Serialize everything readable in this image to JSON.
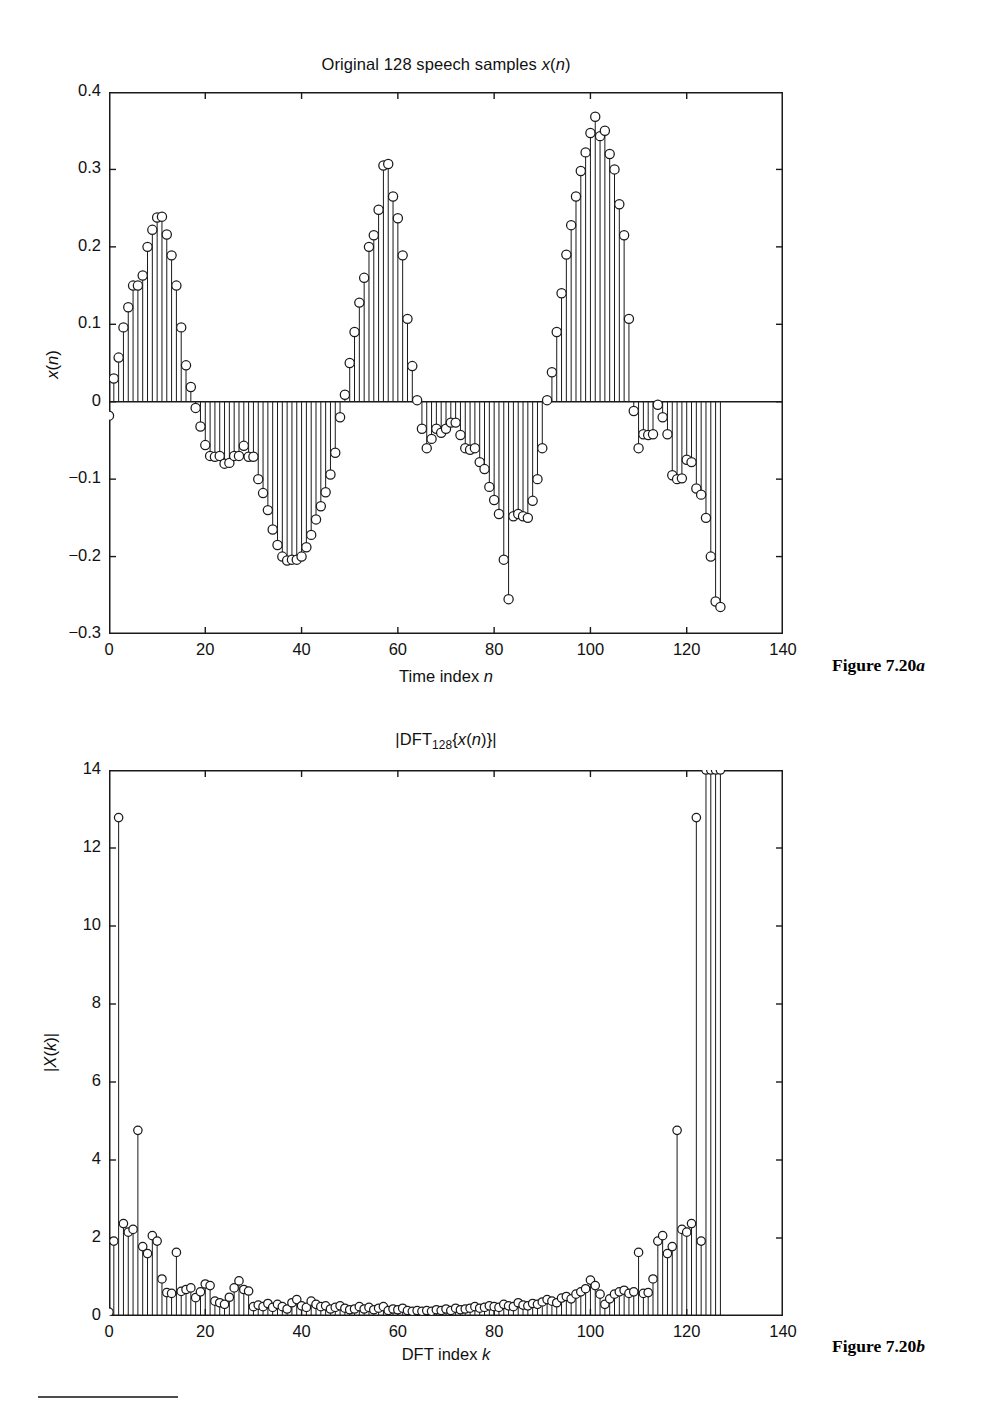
{
  "page": {
    "background": "#ffffff",
    "ink": "#1a1a1a"
  },
  "figures": [
    {
      "id": "fig-a",
      "caption_prefix": "Figure 7.20",
      "caption_suffix": "a",
      "caption_full": "Figure 7.20a"
    },
    {
      "id": "fig-b",
      "caption_prefix": "Figure 7.20",
      "caption_suffix": "b",
      "caption_full": "Figure 7.20b"
    }
  ],
  "chart_data": [
    {
      "type": "line",
      "plot_style": "stem",
      "title": "Original 128 speech samples x(n)",
      "title_parts": {
        "plain": "Original 128 speech samples ",
        "italic": "x",
        "tail": "(n)"
      },
      "xlabel": "Time index n",
      "ylabel": "x(n)",
      "xlim": [
        0,
        140
      ],
      "ylim": [
        -0.3,
        0.4
      ],
      "xticks": [
        0,
        20,
        40,
        60,
        80,
        100,
        120,
        140
      ],
      "xticklabels": [
        "0",
        "20",
        "40",
        "60",
        "80",
        "100",
        "120",
        "140"
      ],
      "yticks": [
        -0.3,
        -0.2,
        -0.1,
        0,
        0.1,
        0.2,
        0.3,
        0.4
      ],
      "yticklabels": [
        "-0.3",
        "-0.2",
        "-0.1",
        "0",
        "0.1",
        "0.2",
        "0.3",
        "0.4"
      ],
      "grid": false,
      "legend": null,
      "marker": "circle-open",
      "baseline": 0,
      "x": [
        0,
        1,
        2,
        3,
        4,
        5,
        6,
        7,
        8,
        9,
        10,
        11,
        12,
        13,
        14,
        15,
        16,
        17,
        18,
        19,
        20,
        21,
        22,
        23,
        24,
        25,
        26,
        27,
        28,
        29,
        30,
        31,
        32,
        33,
        34,
        35,
        36,
        37,
        38,
        39,
        40,
        41,
        42,
        43,
        44,
        45,
        46,
        47,
        48,
        49,
        50,
        51,
        52,
        53,
        54,
        55,
        56,
        57,
        58,
        59,
        60,
        61,
        62,
        63,
        64,
        65,
        66,
        67,
        68,
        69,
        70,
        71,
        72,
        73,
        74,
        75,
        76,
        77,
        78,
        79,
        80,
        81,
        82,
        83,
        84,
        85,
        86,
        87,
        88,
        89,
        90,
        91,
        92,
        93,
        94,
        95,
        96,
        97,
        98,
        99,
        100,
        101,
        102,
        103,
        104,
        105,
        106,
        107,
        108,
        109,
        110,
        111,
        112,
        113,
        114,
        115,
        116,
        117,
        118,
        119,
        120,
        121,
        122,
        123,
        124,
        125,
        126,
        127
      ],
      "values": [
        -0.018,
        0.03,
        0.057,
        0.096,
        0.122,
        0.15,
        0.15,
        0.163,
        0.2,
        0.222,
        0.238,
        0.239,
        0.216,
        0.189,
        0.15,
        0.096,
        0.047,
        0.019,
        -0.008,
        -0.032,
        -0.056,
        -0.07,
        -0.071,
        -0.07,
        -0.08,
        -0.079,
        -0.07,
        -0.07,
        -0.057,
        -0.071,
        -0.071,
        -0.1,
        -0.118,
        -0.14,
        -0.165,
        -0.185,
        -0.2,
        -0.205,
        -0.204,
        -0.204,
        -0.2,
        -0.188,
        -0.172,
        -0.152,
        -0.135,
        -0.117,
        -0.094,
        -0.066,
        -0.02,
        0.009,
        0.05,
        0.09,
        0.128,
        0.16,
        0.2,
        0.215,
        0.248,
        0.305,
        0.307,
        0.265,
        0.237,
        0.189,
        0.107,
        0.046,
        0.002,
        -0.035,
        -0.06,
        -0.048,
        -0.035,
        -0.04,
        -0.035,
        -0.027,
        -0.027,
        -0.043,
        -0.06,
        -0.062,
        -0.06,
        -0.078,
        -0.087,
        -0.11,
        -0.127,
        -0.145,
        -0.204,
        -0.255,
        -0.148,
        -0.145,
        -0.148,
        -0.15,
        -0.128,
        -0.1,
        -0.06,
        0.002,
        0.038,
        0.09,
        0.14,
        0.19,
        0.228,
        0.265,
        0.298,
        0.322,
        0.347,
        0.368,
        0.343,
        0.35,
        0.32,
        0.3,
        0.255,
        0.215,
        0.107,
        -0.012,
        -0.06,
        -0.042,
        -0.043,
        -0.042,
        -0.004,
        -0.02,
        -0.042,
        -0.095,
        -0.1,
        -0.099,
        -0.075,
        -0.078,
        -0.112,
        -0.12,
        -0.15,
        -0.2,
        -0.258,
        -0.265,
        -0.19
      ],
      "n_samples": 128
    },
    {
      "type": "line",
      "plot_style": "stem",
      "title": "|DFT128{x(n)}|",
      "title_parts": {
        "pre": "|DFT",
        "sub": "128",
        "mid": "{",
        "italic": "x",
        "tail": "(n)}|"
      },
      "xlabel": "DFT index k",
      "ylabel": "|X(k)|",
      "xlim": [
        0,
        140
      ],
      "ylim": [
        0,
        14
      ],
      "xticks": [
        0,
        20,
        40,
        60,
        80,
        100,
        120,
        140
      ],
      "xticklabels": [
        "0",
        "20",
        "40",
        "60",
        "80",
        "100",
        "120",
        "140"
      ],
      "yticks": [
        0,
        2,
        4,
        6,
        8,
        10,
        12,
        14
      ],
      "yticklabels": [
        "0",
        "2",
        "4",
        "6",
        "8",
        "10",
        "12",
        "14"
      ],
      "grid": false,
      "legend": null,
      "marker": "circle-open",
      "baseline": 0,
      "x": [
        0,
        1,
        2,
        3,
        4,
        5,
        6,
        7,
        8,
        9,
        10,
        11,
        12,
        13,
        14,
        15,
        16,
        17,
        18,
        19,
        20,
        21,
        22,
        23,
        24,
        25,
        26,
        27,
        28,
        29,
        30,
        31,
        32,
        33,
        34,
        35,
        36,
        37,
        38,
        39,
        40,
        41,
        42,
        43,
        44,
        45,
        46,
        47,
        48,
        49,
        50,
        51,
        52,
        53,
        54,
        55,
        56,
        57,
        58,
        59,
        60,
        61,
        62,
        63,
        64,
        65,
        66,
        67,
        68,
        69,
        70,
        71,
        72,
        73,
        74,
        75,
        76,
        77,
        78,
        79,
        80,
        81,
        82,
        83,
        84,
        85,
        86,
        87,
        88,
        89,
        90,
        91,
        92,
        93,
        94,
        95,
        96,
        97,
        98,
        99,
        100,
        101,
        102,
        103,
        104,
        105,
        106,
        107,
        108,
        109,
        110,
        111,
        112,
        113,
        114,
        115,
        116,
        117,
        118,
        119,
        120,
        121,
        122,
        123,
        124,
        125,
        126,
        127
      ],
      "values": [
        0.1,
        1.92,
        12.78,
        2.37,
        2.15,
        2.22,
        4.76,
        1.78,
        1.6,
        2.06,
        1.92,
        0.95,
        0.6,
        0.58,
        1.63,
        0.63,
        0.68,
        0.72,
        0.47,
        0.62,
        0.82,
        0.78,
        0.38,
        0.34,
        0.3,
        0.48,
        0.72,
        0.9,
        0.68,
        0.64,
        0.24,
        0.28,
        0.24,
        0.32,
        0.22,
        0.3,
        0.24,
        0.18,
        0.34,
        0.42,
        0.26,
        0.22,
        0.38,
        0.3,
        0.24,
        0.26,
        0.18,
        0.22,
        0.26,
        0.2,
        0.16,
        0.18,
        0.24,
        0.18,
        0.22,
        0.16,
        0.2,
        0.24,
        0.14,
        0.18,
        0.16,
        0.2,
        0.14,
        0.12,
        0.14,
        0.12,
        0.14,
        0.12,
        0.16,
        0.14,
        0.18,
        0.14,
        0.2,
        0.16,
        0.18,
        0.2,
        0.24,
        0.2,
        0.22,
        0.26,
        0.24,
        0.22,
        0.3,
        0.26,
        0.24,
        0.34,
        0.28,
        0.26,
        0.32,
        0.3,
        0.36,
        0.42,
        0.38,
        0.34,
        0.46,
        0.5,
        0.44,
        0.56,
        0.62,
        0.7,
        0.92,
        0.78,
        0.56,
        0.3,
        0.44,
        0.56,
        0.62,
        0.66,
        0.58,
        0.62,
        1.63,
        0.58,
        0.6,
        0.95,
        1.92,
        2.06,
        1.6,
        1.78,
        4.76,
        2.22,
        2.15,
        2.37,
        12.78,
        1.92
      ],
      "n_samples": 128,
      "symmetric": true
    }
  ]
}
